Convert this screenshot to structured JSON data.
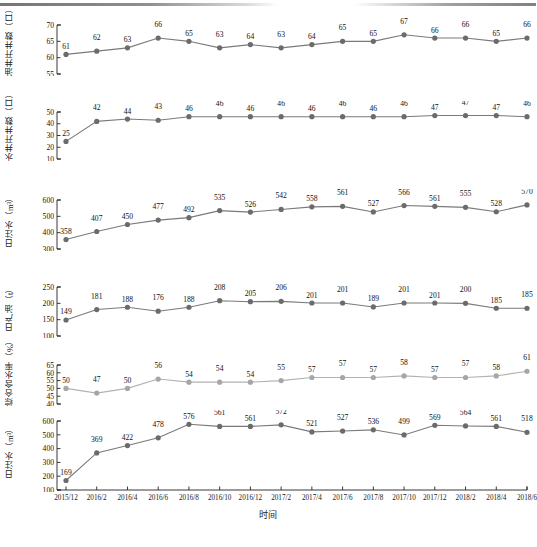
{
  "figure": {
    "x_axis_title": "时间",
    "x_tick_labels": [
      "2015/12",
      "2016/2",
      "2016/4",
      "2016/6",
      "2016/8",
      "2016/10",
      "2016/12",
      "2017/2",
      "2017/4",
      "2017/6",
      "2017/8",
      "2017/10",
      "2017/12",
      "2018/2",
      "2018/4",
      "2018/6"
    ],
    "marker_color_dark": "#6b6b6b",
    "marker_color_light": "#a6a6a6",
    "line_color_dark": "#7a7a7a",
    "line_color_light": "#b2b2b2"
  },
  "chart_data": [
    {
      "type": "line",
      "panel_index": 0,
      "title": "",
      "ylabel": "油井开井数（口）",
      "xlabel": "时间",
      "x": [
        "2015/12",
        "2016/2",
        "2016/4",
        "2016/6",
        "2016/8",
        "2016/10",
        "2016/12",
        "2017/2",
        "2017/4",
        "2017/6",
        "2017/8",
        "2017/10",
        "2017/12",
        "2018/2",
        "2018/4",
        "2018/6"
      ],
      "values": [
        61,
        62,
        63,
        66,
        65,
        63,
        64,
        63,
        64,
        65,
        65,
        67,
        66,
        66,
        65,
        66
      ],
      "ylim": [
        55,
        70
      ],
      "yticks": [
        55,
        60,
        65,
        70
      ],
      "grid": false,
      "series_color": "dark"
    },
    {
      "type": "line",
      "panel_index": 1,
      "title": "",
      "ylabel": "水井开井数（口）",
      "xlabel": "时间",
      "x": [
        "2015/12",
        "2016/2",
        "2016/4",
        "2016/6",
        "2016/8",
        "2016/10",
        "2016/12",
        "2017/2",
        "2017/4",
        "2017/6",
        "2017/8",
        "2017/10",
        "2017/12",
        "2018/2",
        "2018/4",
        "2018/6"
      ],
      "values": [
        25,
        42,
        44,
        43,
        46,
        46,
        46,
        46,
        46,
        46,
        46,
        46,
        47,
        47,
        47,
        46
      ],
      "ylim": [
        10,
        50
      ],
      "yticks": [
        10,
        20,
        30,
        40,
        50
      ],
      "grid": false,
      "series_color": "dark"
    },
    {
      "type": "line",
      "panel_index": 2,
      "title": "",
      "ylabel": "日注水（m³）",
      "xlabel": "时间",
      "x": [
        "2015/12",
        "2016/2",
        "2016/4",
        "2016/6",
        "2016/8",
        "2016/10",
        "2016/12",
        "2017/2",
        "2017/4",
        "2017/6",
        "2017/8",
        "2017/10",
        "2017/12",
        "2018/2",
        "2018/4",
        "2018/6"
      ],
      "values": [
        358,
        407,
        450,
        477,
        492,
        535,
        526,
        542,
        558,
        561,
        527,
        566,
        561,
        555,
        528,
        570
      ],
      "ylim": [
        300,
        600
      ],
      "yticks": [
        300,
        400,
        500,
        600
      ],
      "grid": false,
      "series_color": "dark"
    },
    {
      "type": "line",
      "panel_index": 3,
      "title": "",
      "ylabel": "日产油（t）",
      "xlabel": "时间",
      "x": [
        "2015/12",
        "2016/2",
        "2016/4",
        "2016/6",
        "2016/8",
        "2016/10",
        "2016/12",
        "2017/2",
        "2017/4",
        "2017/6",
        "2017/8",
        "2017/10",
        "2017/12",
        "2018/2",
        "2018/4",
        "2018/6"
      ],
      "values": [
        149,
        181,
        188,
        176,
        188,
        208,
        205,
        206,
        201,
        201,
        189,
        201,
        201,
        200,
        185,
        185
      ],
      "ylim": [
        100,
        250
      ],
      "yticks": [
        100,
        150,
        200,
        250
      ],
      "grid": false,
      "series_color": "dark"
    },
    {
      "type": "line",
      "panel_index": 4,
      "title": "",
      "ylabel": "综合含水率（%）",
      "xlabel": "时间",
      "x": [
        "2015/12",
        "2016/2",
        "2016/4",
        "2016/6",
        "2016/8",
        "2016/10",
        "2016/12",
        "2017/2",
        "2017/4",
        "2017/6",
        "2017/8",
        "2017/10",
        "2017/12",
        "2018/2",
        "2018/4",
        "2018/6"
      ],
      "values": [
        50,
        47,
        50,
        56,
        54,
        54,
        54,
        55,
        57,
        57,
        57,
        58,
        57,
        57,
        58,
        61
      ],
      "ylim": [
        40,
        65
      ],
      "yticks": [
        40,
        45,
        50,
        55,
        60,
        65
      ],
      "grid": false,
      "series_color": "light"
    },
    {
      "type": "line",
      "panel_index": 5,
      "title": "",
      "ylabel": "日注水（m³）",
      "xlabel": "时间",
      "x": [
        "2015/12",
        "2016/2",
        "2016/4",
        "2016/6",
        "2016/8",
        "2016/10",
        "2016/12",
        "2017/2",
        "2017/4",
        "2017/6",
        "2017/8",
        "2017/10",
        "2017/12",
        "2018/2",
        "2018/4",
        "2018/6"
      ],
      "values": [
        169,
        369,
        422,
        478,
        576,
        561,
        561,
        572,
        521,
        527,
        536,
        499,
        569,
        564,
        561,
        518
      ],
      "ylim": [
        100,
        600
      ],
      "yticks": [
        100,
        200,
        300,
        400,
        500,
        600
      ],
      "grid": false,
      "series_color": "dark"
    }
  ]
}
